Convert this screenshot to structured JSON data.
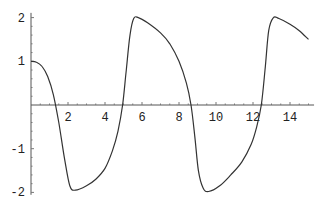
{
  "chart_data": {
    "type": "line",
    "title": "",
    "xlabel": "",
    "ylabel": "",
    "xlim": [
      0,
      15.3
    ],
    "ylim": [
      -2.1,
      2.2
    ],
    "grid": false,
    "legend": null,
    "x_ticks": [
      2,
      4,
      6,
      8,
      10,
      12,
      14
    ],
    "x_tick_labels": [
      "2",
      "4",
      "6",
      "8",
      "10",
      "12",
      "14"
    ],
    "y_ticks": [
      -2,
      -1,
      1,
      2
    ],
    "y_tick_labels": [
      "-2",
      "-1",
      "1",
      "2"
    ],
    "series": [
      {
        "name": "x(t)",
        "x": [
          0,
          0.3,
          0.6,
          0.9,
          1.2,
          1.5,
          1.8,
          2.1,
          2.4,
          3.0,
          3.5,
          4.0,
          4.4,
          4.7,
          4.95,
          5.15,
          5.35,
          5.55,
          5.8,
          6.3,
          7.0,
          7.5,
          8.0,
          8.4,
          8.65,
          8.85,
          9.05,
          9.3,
          9.6,
          10.2,
          10.8,
          11.4,
          11.9,
          12.2,
          12.45,
          12.65,
          12.85,
          13.1,
          13.4,
          14.0,
          14.5,
          15.0
        ],
        "y": [
          1.0,
          0.98,
          0.88,
          0.65,
          0.25,
          -0.4,
          -1.2,
          -1.85,
          -1.95,
          -1.85,
          -1.7,
          -1.45,
          -1.05,
          -0.6,
          0.0,
          0.8,
          1.6,
          1.98,
          2.0,
          1.88,
          1.65,
          1.4,
          1.0,
          0.5,
          0.0,
          -0.7,
          -1.5,
          -1.9,
          -1.98,
          -1.85,
          -1.6,
          -1.3,
          -0.9,
          -0.5,
          0.0,
          0.8,
          1.7,
          2.0,
          1.98,
          1.85,
          1.7,
          1.5
        ]
      }
    ]
  }
}
